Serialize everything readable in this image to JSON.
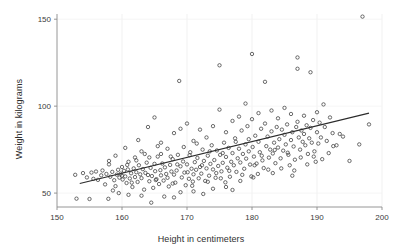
{
  "chart_data": {
    "type": "scatter",
    "title": "",
    "xlabel": "Height in centimeters",
    "ylabel": "Weight in kilograms",
    "xlim": [
      150,
      200
    ],
    "ylim": [
      42,
      153
    ],
    "xticks": [
      150,
      160,
      170,
      180,
      190,
      200
    ],
    "yticks": [
      50,
      100,
      150
    ],
    "grid": true,
    "legend": null,
    "marker": "open-circle",
    "marker_color": "#3c3c3c",
    "line_color": "#2b2b2b",
    "trendline": {
      "label": "linear fit",
      "x": [
        153.5,
        198.0
      ],
      "y": [
        55.5,
        96.0
      ]
    },
    "series": [
      {
        "name": "observations",
        "points": [
          [
            152.8,
            60.5
          ],
          [
            153.0,
            46.8
          ],
          [
            154.0,
            61.5
          ],
          [
            154.6,
            59.0
          ],
          [
            155.0,
            46.6
          ],
          [
            155.3,
            61.8
          ],
          [
            155.6,
            58.2
          ],
          [
            156.0,
            62.4
          ],
          [
            156.3,
            57.6
          ],
          [
            156.8,
            60.2
          ],
          [
            157.0,
            63.0
          ],
          [
            157.4,
            55.0
          ],
          [
            157.6,
            61.0
          ],
          [
            157.9,
            46.7
          ],
          [
            158.0,
            66.5
          ],
          [
            158.2,
            59.4
          ],
          [
            158.5,
            62.2
          ],
          [
            158.8,
            57.4
          ],
          [
            159.0,
            71.5
          ],
          [
            159.2,
            60.6
          ],
          [
            159.4,
            63.4
          ],
          [
            159.6,
            58.9
          ],
          [
            159.8,
            61.2
          ],
          [
            160.0,
            65.0
          ],
          [
            160.0,
            60.0
          ],
          [
            160.1,
            57.8
          ],
          [
            160.3,
            62.8
          ],
          [
            160.5,
            59.6
          ],
          [
            160.7,
            55.8
          ],
          [
            160.9,
            63.6
          ],
          [
            161.0,
            68.0
          ],
          [
            161.2,
            58.4
          ],
          [
            161.4,
            61.4
          ],
          [
            161.6,
            53.5
          ],
          [
            161.8,
            64.2
          ],
          [
            162.0,
            70.5
          ],
          [
            162.0,
            59.2
          ],
          [
            162.2,
            62.0
          ],
          [
            162.4,
            56.4
          ],
          [
            162.6,
            66.0
          ],
          [
            162.8,
            60.8
          ],
          [
            163.0,
            74.0
          ],
          [
            163.0,
            58.6
          ],
          [
            163.2,
            63.8
          ],
          [
            163.4,
            52.0
          ],
          [
            163.6,
            61.6
          ],
          [
            163.8,
            67.5
          ],
          [
            164.0,
            88.0
          ],
          [
            164.0,
            60.4
          ],
          [
            164.2,
            56.8
          ],
          [
            164.4,
            64.5
          ],
          [
            164.6,
            59.8
          ],
          [
            164.8,
            53.0
          ],
          [
            165.0,
            93.5
          ],
          [
            165.0,
            66.8
          ],
          [
            165.1,
            62.6
          ],
          [
            165.3,
            58.0
          ],
          [
            165.5,
            71.0
          ],
          [
            165.7,
            55.2
          ],
          [
            165.9,
            63.2
          ],
          [
            166.0,
            79.0
          ],
          [
            166.0,
            60.2
          ],
          [
            166.2,
            67.0
          ],
          [
            166.4,
            57.2
          ],
          [
            166.6,
            64.8
          ],
          [
            166.8,
            61.0
          ],
          [
            167.0,
            75.5
          ],
          [
            167.0,
            58.8
          ],
          [
            167.2,
            53.8
          ],
          [
            167.4,
            66.2
          ],
          [
            167.6,
            62.4
          ],
          [
            167.8,
            69.5
          ],
          [
            168.0,
            84.5
          ],
          [
            168.0,
            60.6
          ],
          [
            168.2,
            56.0
          ],
          [
            168.4,
            63.0
          ],
          [
            168.6,
            72.0
          ],
          [
            168.8,
            114.5
          ],
          [
            169.0,
            87.0
          ],
          [
            169.0,
            65.4
          ],
          [
            169.2,
            59.0
          ],
          [
            169.4,
            68.2
          ],
          [
            169.6,
            61.8
          ],
          [
            169.8,
            54.5
          ],
          [
            170.0,
            90.0
          ],
          [
            170.0,
            66.5
          ],
          [
            170.1,
            62.0
          ],
          [
            170.3,
            58.2
          ],
          [
            170.5,
            73.5
          ],
          [
            170.7,
            64.0
          ],
          [
            170.9,
            56.6
          ],
          [
            171.0,
            80.0
          ],
          [
            171.0,
            60.8
          ],
          [
            171.2,
            67.8
          ],
          [
            171.4,
            63.4
          ],
          [
            171.6,
            70.2
          ],
          [
            171.8,
            58.5
          ],
          [
            172.0,
            86.5
          ],
          [
            172.0,
            65.0
          ],
          [
            172.2,
            61.2
          ],
          [
            172.4,
            75.0
          ],
          [
            172.6,
            68.5
          ],
          [
            172.8,
            57.0
          ],
          [
            173.0,
            82.0
          ],
          [
            173.0,
            64.2
          ],
          [
            173.2,
            71.5
          ],
          [
            173.4,
            60.0
          ],
          [
            173.6,
            66.8
          ],
          [
            173.8,
            77.5
          ],
          [
            174.0,
            88.5
          ],
          [
            174.0,
            63.6
          ],
          [
            174.2,
            69.0
          ],
          [
            174.4,
            58.8
          ],
          [
            174.6,
            74.5
          ],
          [
            174.8,
            65.6
          ],
          [
            175.0,
            123.5
          ],
          [
            175.0,
            98.0
          ],
          [
            175.1,
            72.0
          ],
          [
            175.3,
            62.5
          ],
          [
            175.5,
            67.4
          ],
          [
            175.7,
            79.0
          ],
          [
            175.9,
            56.2
          ],
          [
            176.0,
            85.0
          ],
          [
            176.0,
            70.8
          ],
          [
            176.2,
            64.6
          ],
          [
            176.4,
            76.0
          ],
          [
            176.6,
            59.4
          ],
          [
            176.8,
            68.0
          ],
          [
            177.0,
            91.5
          ],
          [
            177.0,
            73.0
          ],
          [
            177.2,
            66.0
          ],
          [
            177.4,
            81.5
          ],
          [
            177.6,
            62.2
          ],
          [
            177.8,
            70.0
          ],
          [
            178.0,
            94.0
          ],
          [
            178.0,
            75.5
          ],
          [
            178.2,
            67.6
          ],
          [
            178.4,
            86.0
          ],
          [
            178.6,
            72.5
          ],
          [
            178.8,
            64.0
          ],
          [
            179.0,
            101.5
          ],
          [
            179.0,
            78.0
          ],
          [
            179.1,
            69.8
          ],
          [
            179.3,
            88.5
          ],
          [
            179.5,
            74.0
          ],
          [
            179.7,
            66.4
          ],
          [
            179.9,
            59.6
          ],
          [
            180.0,
            130.0
          ],
          [
            180.0,
            92.5
          ],
          [
            180.1,
            76.5
          ],
          [
            180.3,
            71.0
          ],
          [
            180.5,
            83.0
          ],
          [
            180.7,
            67.0
          ],
          [
            180.9,
            61.0
          ],
          [
            181.0,
            96.0
          ],
          [
            181.0,
            79.5
          ],
          [
            181.2,
            73.5
          ],
          [
            181.4,
            87.0
          ],
          [
            181.6,
            68.8
          ],
          [
            181.8,
            64.4
          ],
          [
            182.0,
            114.0
          ],
          [
            182.0,
            90.0
          ],
          [
            182.2,
            77.0
          ],
          [
            182.4,
            82.5
          ],
          [
            182.6,
            70.4
          ],
          [
            182.8,
            75.0
          ],
          [
            183.0,
            97.5
          ],
          [
            183.0,
            85.5
          ],
          [
            183.2,
            72.8
          ],
          [
            183.4,
            79.0
          ],
          [
            183.6,
            67.2
          ],
          [
            183.8,
            88.0
          ],
          [
            184.0,
            93.0
          ],
          [
            184.0,
            76.2
          ],
          [
            184.2,
            81.0
          ],
          [
            184.4,
            70.0
          ],
          [
            184.6,
            86.5
          ],
          [
            184.8,
            74.4
          ],
          [
            185.0,
            99.0
          ],
          [
            185.0,
            83.5
          ],
          [
            185.2,
            78.0
          ],
          [
            185.4,
            89.5
          ],
          [
            185.6,
            72.0
          ],
          [
            185.8,
            66.0
          ],
          [
            186.0,
            95.5
          ],
          [
            186.0,
            80.5
          ],
          [
            186.2,
            85.0
          ],
          [
            186.4,
            76.8
          ],
          [
            186.6,
            69.2
          ],
          [
            186.8,
            88.0
          ],
          [
            187.0,
            128.0
          ],
          [
            187.0,
            121.5
          ],
          [
            187.0,
            91.0
          ],
          [
            187.2,
            82.0
          ],
          [
            187.4,
            75.0
          ],
          [
            187.6,
            86.0
          ],
          [
            187.8,
            79.5
          ],
          [
            188.0,
            94.5
          ],
          [
            188.0,
            84.0
          ],
          [
            188.2,
            77.5
          ],
          [
            188.4,
            89.0
          ],
          [
            188.6,
            72.5
          ],
          [
            188.8,
            81.5
          ],
          [
            189.0,
            119.5
          ],
          [
            189.0,
            87.5
          ],
          [
            189.2,
            79.0
          ],
          [
            189.4,
            92.0
          ],
          [
            189.6,
            74.0
          ],
          [
            189.8,
            68.0
          ],
          [
            190.0,
            96.5
          ],
          [
            190.0,
            85.0
          ],
          [
            190.2,
            78.5
          ],
          [
            190.4,
            90.5
          ],
          [
            190.6,
            82.0
          ],
          [
            191.0,
            101.0
          ],
          [
            191.2,
            88.0
          ],
          [
            191.5,
            80.0
          ],
          [
            192.0,
            93.5
          ],
          [
            192.4,
            84.5
          ],
          [
            193.0,
            77.5
          ],
          [
            194.0,
            82.5
          ],
          [
            195.0,
            68.5
          ],
          [
            196.5,
            78.0
          ],
          [
            197.0,
            151.5
          ],
          [
            198.0,
            89.5
          ],
          [
            158.6,
            51.5
          ],
          [
            159.5,
            50.0
          ],
          [
            161.0,
            49.0
          ],
          [
            163.0,
            48.5
          ],
          [
            164.5,
            44.5
          ],
          [
            166.5,
            48.0
          ],
          [
            168.0,
            47.5
          ],
          [
            169.0,
            50.5
          ],
          [
            171.0,
            51.0
          ],
          [
            172.5,
            49.5
          ],
          [
            174.0,
            52.5
          ],
          [
            176.0,
            53.5
          ],
          [
            177.0,
            51.8
          ],
          [
            160.5,
            76.0
          ],
          [
            162.5,
            80.5
          ],
          [
            163.5,
            72.5
          ],
          [
            165.5,
            77.0
          ],
          [
            167.5,
            71.0
          ],
          [
            169.5,
            76.5
          ],
          [
            171.5,
            78.5
          ],
          [
            173.5,
            74.0
          ],
          [
            175.5,
            73.0
          ],
          [
            177.5,
            79.5
          ],
          [
            179.5,
            81.0
          ],
          [
            181.5,
            71.5
          ],
          [
            183.5,
            74.8
          ],
          [
            185.5,
            73.2
          ],
          [
            187.5,
            70.5
          ],
          [
            189.5,
            71.0
          ],
          [
            191.8,
            73.0
          ],
          [
            158.0,
            68.5
          ],
          [
            160.8,
            66.2
          ],
          [
            162.2,
            68.8
          ],
          [
            164.2,
            70.5
          ],
          [
            166.0,
            72.5
          ],
          [
            168.5,
            66.5
          ],
          [
            170.4,
            71.8
          ],
          [
            172.3,
            66.0
          ],
          [
            174.5,
            61.5
          ],
          [
            176.5,
            62.8
          ],
          [
            178.5,
            60.5
          ],
          [
            180.4,
            66.0
          ],
          [
            182.5,
            63.5
          ],
          [
            184.5,
            64.2
          ],
          [
            186.5,
            63.0
          ],
          [
            188.5,
            66.5
          ],
          [
            190.8,
            69.5
          ],
          [
            159.0,
            54.0
          ],
          [
            161.5,
            56.0
          ],
          [
            165.2,
            57.5
          ],
          [
            167.8,
            55.5
          ],
          [
            170.8,
            54.2
          ],
          [
            173.2,
            56.5
          ],
          [
            175.2,
            58.5
          ],
          [
            178.2,
            57.0
          ],
          [
            180.2,
            59.0
          ],
          [
            183.2,
            61.5
          ],
          [
            186.2,
            60.0
          ],
          [
            192.5,
            77.0
          ],
          [
            193.5,
            84.0
          ]
        ]
      }
    ]
  }
}
